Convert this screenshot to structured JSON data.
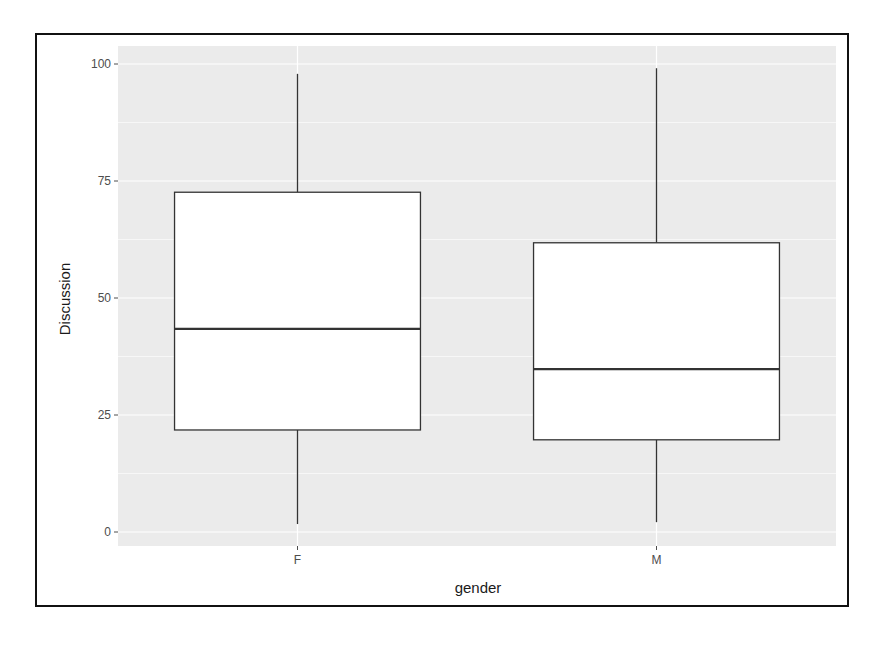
{
  "chart_data": {
    "type": "boxplot",
    "title": "",
    "xlabel": "gender",
    "ylabel": "Discussion",
    "categories": [
      "F",
      "M"
    ],
    "ylim": [
      -3,
      103
    ],
    "yticks": [
      0,
      25,
      50,
      75,
      100
    ],
    "ytick_labels": [
      "0",
      "25",
      "50",
      "75",
      "100"
    ],
    "grid": true,
    "legend": null,
    "series": [
      {
        "name": "F",
        "whisker_low": 1.7,
        "q1": 21.8,
        "median": 43.4,
        "q3": 72.6,
        "whisker_high": 97.9
      },
      {
        "name": "M",
        "whisker_low": 2.1,
        "q1": 19.7,
        "median": 34.8,
        "q3": 61.8,
        "whisker_high": 99.1
      }
    ]
  },
  "colors": {
    "panel_background": "#ebebeb",
    "grid_major": "#ffffff",
    "box_fill": "#ffffff",
    "box_line": "#333333",
    "frame": "#111111"
  }
}
